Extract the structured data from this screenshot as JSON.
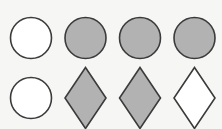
{
  "figure": {
    "background": "#f6f6f4",
    "stroke_color": "#3b3b3b",
    "stroke_width": 1.6,
    "fill_gray": "#b2b2b2",
    "fill_white": "#ffffff",
    "rows": [
      {
        "cy": 38,
        "shapes": [
          {
            "type": "circle",
            "cx": 31,
            "r": 20.5,
            "fill": "white"
          },
          {
            "type": "circle",
            "cx": 85.5,
            "r": 20.5,
            "fill": "gray"
          },
          {
            "type": "circle",
            "cx": 140,
            "r": 20.5,
            "fill": "gray"
          },
          {
            "type": "circle",
            "cx": 194.5,
            "r": 20.5,
            "fill": "gray"
          }
        ]
      },
      {
        "cy": 98,
        "shapes": [
          {
            "type": "circle",
            "cx": 31,
            "r": 20.5,
            "fill": "white"
          },
          {
            "type": "diamond",
            "cx": 85.5,
            "hw": 20.5,
            "hh": 30.5,
            "fill": "gray"
          },
          {
            "type": "diamond",
            "cx": 140,
            "hw": 20.5,
            "hh": 30.5,
            "fill": "gray"
          },
          {
            "type": "diamond",
            "cx": 194.5,
            "hw": 20.5,
            "hh": 30.5,
            "fill": "white"
          }
        ]
      }
    ]
  }
}
